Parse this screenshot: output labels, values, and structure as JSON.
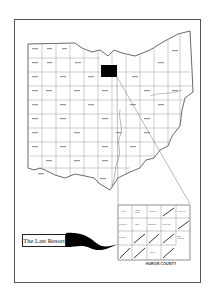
{
  "map": {
    "title": "The Last Resort",
    "state": "Ohio",
    "highlighted_county": "Huron",
    "highlight_color": "#000000",
    "border_color": "#555555"
  },
  "inset": {
    "caption": "HURON COUNTY",
    "townships": [
      {
        "name": "LYME",
        "row": 0,
        "col": 0
      },
      {
        "name": "RIDGE FIELD",
        "row": 0,
        "col": 1
      },
      {
        "name": "NORWALK",
        "row": 0,
        "col": 2
      },
      {
        "name": "",
        "row": 0,
        "col": 3,
        "hatched": true
      },
      {
        "name": "WAKEMAN",
        "row": 0,
        "col": 4
      },
      {
        "name": "SHERMAN",
        "row": 1,
        "col": 0
      },
      {
        "name": "PERU",
        "row": 1,
        "col": 1
      },
      {
        "name": "BRONSON",
        "row": 1,
        "col": 2
      },
      {
        "name": "HARTLAND",
        "row": 1,
        "col": 3
      },
      {
        "name": "",
        "row": 1,
        "col": 4,
        "hatched": true
      },
      {
        "name": "NORWICH",
        "row": 2,
        "col": 0
      },
      {
        "name": "",
        "row": 2,
        "col": 1,
        "hatched": true
      },
      {
        "name": "",
        "row": 2,
        "col": 2,
        "hatched": true
      },
      {
        "name": "",
        "row": 2,
        "col": 3,
        "hatched": true
      },
      {
        "name": "NEW LONDON",
        "row": 2,
        "col": 4
      },
      {
        "name": "",
        "row": 3,
        "col": 0,
        "hatched": true
      },
      {
        "name": "",
        "row": 3,
        "col": 1,
        "hatched": true
      },
      {
        "name": "RIPLEY",
        "row": 3,
        "col": 2
      },
      {
        "name": "",
        "row": 3,
        "col": 3,
        "hatched": true
      }
    ]
  }
}
